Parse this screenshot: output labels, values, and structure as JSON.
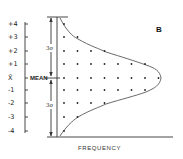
{
  "figure": {
    "panel_label": "B",
    "x_axis_title": "FREQUENCY",
    "mean_label": "MEAN",
    "mean_symbol": "X̄",
    "upper_span_label": "3σ",
    "lower_span_label": "3σ",
    "y_ticks": [
      {
        "label": "+4",
        "y": 24
      },
      {
        "label": "+3",
        "y": 37
      },
      {
        "label": "+2",
        "y": 51
      },
      {
        "label": "+1",
        "y": 64
      },
      {
        "label": "X̄",
        "y": 78
      },
      {
        "label": "-1",
        "y": 90
      },
      {
        "label": "-2",
        "y": 103
      },
      {
        "label": "-3",
        "y": 117
      },
      {
        "label": "-4",
        "y": 131
      }
    ],
    "colors": {
      "ink": "#222222",
      "background": "#ffffff"
    }
  },
  "chart_data": {
    "type": "diagram",
    "title": "B",
    "xlabel": "FREQUENCY",
    "ylabel": "Deviation from mean (σ)",
    "y_categories": [
      "+4",
      "+3",
      "+2",
      "+1",
      "X̄ MEAN",
      "-1",
      "-2",
      "-3",
      "-4"
    ],
    "dot_counts_per_row": [
      1,
      2,
      4,
      7,
      8,
      7,
      4,
      2,
      1
    ],
    "annotations": [
      "3σ above mean",
      "3σ below mean",
      "MEAN"
    ]
  }
}
